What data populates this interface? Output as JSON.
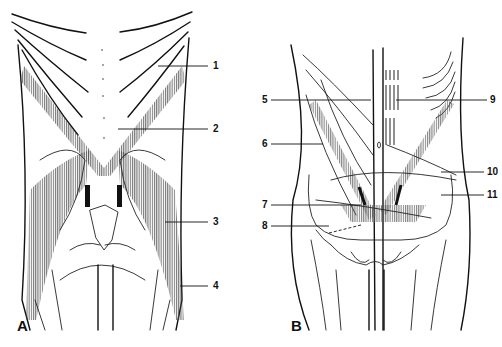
{
  "figure": {
    "panels": [
      {
        "letter": "A",
        "callouts": [
          {
            "number": "1",
            "x": 213,
            "y": 66
          },
          {
            "number": "2",
            "x": 213,
            "y": 129
          },
          {
            "number": "3",
            "x": 213,
            "y": 222
          },
          {
            "number": "4",
            "x": 213,
            "y": 286
          }
        ]
      },
      {
        "letter": "B",
        "callouts": [
          {
            "number": "5",
            "x": 262,
            "y": 100
          },
          {
            "number": "6",
            "x": 262,
            "y": 144
          },
          {
            "number": "7",
            "x": 262,
            "y": 205
          },
          {
            "number": "8",
            "x": 262,
            "y": 226
          },
          {
            "number": "9",
            "x": 490,
            "y": 100
          },
          {
            "number": "10",
            "x": 487,
            "y": 172
          },
          {
            "number": "11",
            "x": 487,
            "y": 195
          }
        ]
      }
    ]
  },
  "colors": {
    "line": "#111111",
    "hatch": "#555555",
    "background": "#ffffff"
  }
}
